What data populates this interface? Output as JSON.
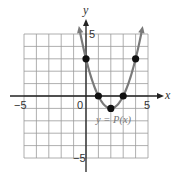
{
  "chart_data": {
    "type": "line",
    "title": "",
    "xlabel": "x",
    "ylabel": "y",
    "xlim": [
      -5,
      5
    ],
    "ylim": [
      -5,
      5
    ],
    "grid": true,
    "x_tick_labels": [
      "-5",
      "0",
      "5"
    ],
    "y_tick_labels": [
      "5",
      "-5"
    ],
    "series": [
      {
        "name": "y = P(x)",
        "function": "(x-2)^2 - 1",
        "points": [
          {
            "x": 0,
            "y": 3
          },
          {
            "x": 1,
            "y": 0
          },
          {
            "x": 2,
            "y": -1
          },
          {
            "x": 3,
            "y": 0
          },
          {
            "x": 4,
            "y": 3
          }
        ]
      }
    ],
    "annotations": [
      "y = P(x)"
    ]
  },
  "labels": {
    "x_axis": "x",
    "y_axis": "y",
    "x_min": "−5",
    "x_zero": "0",
    "x_max": "5",
    "y_max": "5",
    "y_min": "−5",
    "curve": "y = P(x)"
  },
  "colors": {
    "grid": "#9a9a9a",
    "axis": "#222222",
    "curve": "#7a7a7a",
    "points": "#111111"
  }
}
